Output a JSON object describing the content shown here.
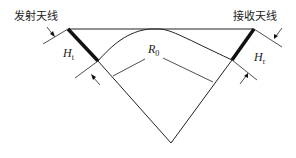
{
  "diagram": {
    "type": "radio-link-earth-curvature",
    "labels": {
      "transmit_antenna": "发射天线",
      "receive_antenna": "接收天线",
      "ht_symbol": "H",
      "ht_subscript": "t",
      "hr_symbol": "H",
      "hr_subscript": "r",
      "r0_symbol": "R",
      "r0_subscript": "0"
    },
    "colors": {
      "line": "#222222",
      "antenna": "#111111",
      "background": "#ffffff"
    }
  }
}
